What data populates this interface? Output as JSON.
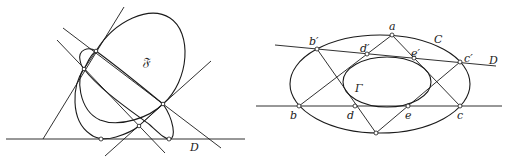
{
  "left_figure": {
    "labels": {
      "conic": "𝔉",
      "line": "D"
    },
    "points": [
      {
        "id": "p1",
        "x": 96,
        "y": 51
      },
      {
        "id": "p2",
        "x": 84,
        "y": 69
      },
      {
        "id": "p3",
        "x": 163,
        "y": 104
      },
      {
        "id": "p4",
        "x": 139,
        "y": 126
      },
      {
        "id": "t1",
        "x": 101,
        "y": 139
      },
      {
        "id": "t2",
        "x": 169,
        "y": 139
      }
    ]
  },
  "right_figure": {
    "labels": {
      "outer_conic": "C",
      "inner_conic": "Γ",
      "line": "D",
      "a": "a",
      "b_prime": "b′",
      "d_prime": "d′",
      "e_prime": "e′",
      "c_prime": "c′",
      "b": "b",
      "d": "d",
      "e": "e",
      "c": "c"
    },
    "points": [
      {
        "id": "a",
        "x": 392,
        "y": 35
      },
      {
        "id": "b_prime",
        "x": 317,
        "y": 49
      },
      {
        "id": "d_prime",
        "x": 367,
        "y": 54
      },
      {
        "id": "e_prime",
        "x": 414,
        "y": 58
      },
      {
        "id": "c_prime",
        "x": 460,
        "y": 62
      },
      {
        "id": "b",
        "x": 299,
        "y": 106
      },
      {
        "id": "d",
        "x": 355,
        "y": 106
      },
      {
        "id": "e",
        "x": 408,
        "y": 106
      },
      {
        "id": "c",
        "x": 460,
        "y": 106
      },
      {
        "id": "bottom",
        "x": 376,
        "y": 133
      }
    ]
  }
}
